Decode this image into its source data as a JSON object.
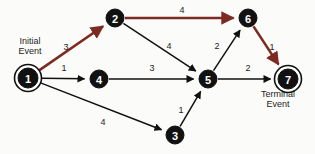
{
  "diagram": {
    "colors": {
      "normal_edge": "#111111",
      "critical_edge": "#7d2a22",
      "node_fill": "#111111",
      "node_text": "#ffffff",
      "background": "#fbfbfa"
    },
    "annotations": [
      {
        "id": "initial-event",
        "line1": "Initial",
        "line2": "Event",
        "x": 30,
        "y": 44
      },
      {
        "id": "terminal-event",
        "line1": "Terminal",
        "line2": "Event",
        "x": 278,
        "y": 97
      }
    ],
    "nodes": [
      {
        "id": "1",
        "label": "1",
        "x": 28,
        "y": 78,
        "r": 10,
        "double_ring": true
      },
      {
        "id": "2",
        "label": "2",
        "x": 115,
        "y": 18,
        "r": 9,
        "double_ring": false
      },
      {
        "id": "3",
        "label": "3",
        "x": 175,
        "y": 135,
        "r": 9,
        "double_ring": false
      },
      {
        "id": "4",
        "label": "4",
        "x": 99,
        "y": 79,
        "r": 9,
        "double_ring": false
      },
      {
        "id": "5",
        "label": "5",
        "x": 208,
        "y": 79,
        "r": 9,
        "double_ring": false
      },
      {
        "id": "6",
        "label": "6",
        "x": 248,
        "y": 18,
        "r": 9,
        "double_ring": false
      },
      {
        "id": "7",
        "label": "7",
        "x": 288,
        "y": 79,
        "r": 10,
        "double_ring": true
      }
    ],
    "edges": [
      {
        "id": "e1-2",
        "from": "1",
        "to": "2",
        "weight": "3",
        "critical": true,
        "lx": 66,
        "ly": 47
      },
      {
        "id": "e2-6",
        "from": "2",
        "to": "6",
        "weight": "4",
        "critical": true,
        "lx": 182,
        "ly": 10
      },
      {
        "id": "e6-7",
        "from": "6",
        "to": "7",
        "weight": "1",
        "critical": true,
        "lx": 272,
        "ly": 47
      },
      {
        "id": "e1-4",
        "from": "1",
        "to": "4",
        "weight": "1",
        "critical": false,
        "lx": 64,
        "ly": 68
      },
      {
        "id": "e4-5",
        "from": "4",
        "to": "5",
        "weight": "3",
        "critical": false,
        "lx": 152,
        "ly": 68
      },
      {
        "id": "e2-5",
        "from": "2",
        "to": "5",
        "weight": "4",
        "critical": false,
        "lx": 169,
        "ly": 46
      },
      {
        "id": "e5-6",
        "from": "5",
        "to": "6",
        "weight": "2",
        "critical": false,
        "lx": 217,
        "ly": 46
      },
      {
        "id": "e5-7",
        "from": "5",
        "to": "7",
        "weight": "2",
        "critical": false,
        "lx": 248,
        "ly": 68
      },
      {
        "id": "e1-3",
        "from": "1",
        "to": "3",
        "weight": "4",
        "critical": false,
        "lx": 103,
        "ly": 122
      },
      {
        "id": "e3-5",
        "from": "3",
        "to": "5",
        "weight": "1",
        "critical": false,
        "lx": 181,
        "ly": 110
      }
    ]
  }
}
